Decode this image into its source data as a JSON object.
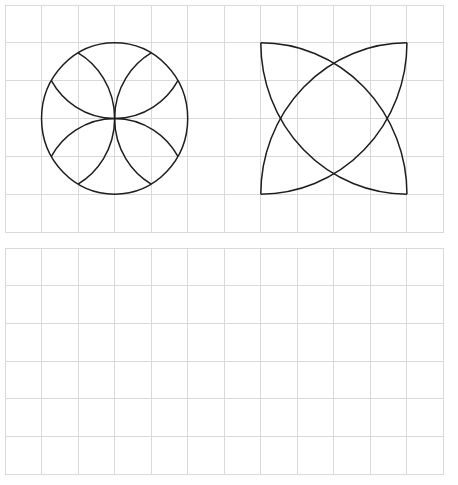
{
  "canvas": {
    "width": 458,
    "height": 485,
    "background": "#ffffff"
  },
  "colors": {
    "grid": "#d9d9d9",
    "figure_stroke": "#1e1e1e"
  },
  "panels": [
    {
      "name": "top-grid",
      "x": 4.5,
      "y": 5,
      "width": 438.5,
      "height": 227,
      "cols": 12,
      "rows": 6,
      "figures": [
        {
          "name": "circle-with-four-petal-arcs",
          "type": "circle_with_inner_arcs",
          "center": [
            3,
            3
          ],
          "radius": 2,
          "inner_arcs": "arcs of equal radius centered at top, bottom, left, right points of the circle, passing through center"
        },
        {
          "name": "four-quarter-arc-star",
          "type": "quarter_arcs_in_square",
          "square": {
            "col0": 7,
            "row0": 1,
            "col1": 11,
            "row1": 5
          },
          "arcs": "four quarter-circle arcs each centered on a square corner, radius equal to square side"
        }
      ]
    },
    {
      "name": "bottom-grid",
      "x": 4.5,
      "y": 248,
      "width": 438.5,
      "height": 226,
      "cols": 12,
      "rows": 6,
      "figures": []
    }
  ]
}
